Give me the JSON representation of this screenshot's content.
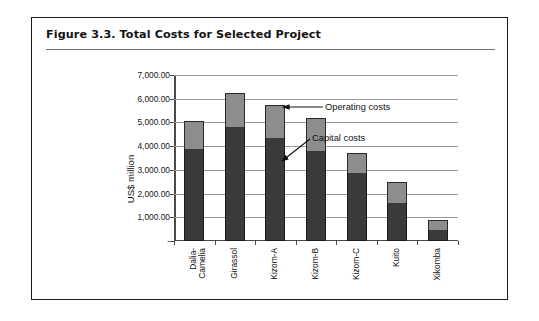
{
  "figure": {
    "title": "Figure 3.3.  Total Costs for Selected Project"
  },
  "chart_data": {
    "type": "bar",
    "subtype": "stacked",
    "title": "Figure 3.3.  Total Costs for Selected Project",
    "xlabel": "",
    "ylabel": "US$ million",
    "ylim": [
      0,
      7000
    ],
    "grid": true,
    "legend_position": "annotations",
    "ytick_labels": [
      "7,000.00",
      "6,000.00",
      "5,000.00",
      "4,000.00",
      "3,000.00",
      "2,000.00",
      "1,000.00",
      "-"
    ],
    "ytick_values": [
      7000,
      6000,
      5000,
      4000,
      3000,
      2000,
      1000,
      0
    ],
    "categories": [
      "Dalia-\nCamelia",
      "Girassol",
      "Kizom-A",
      "Kizom-B",
      "Kizom-C",
      "Kuito",
      "Xikomba"
    ],
    "series": [
      {
        "name": "Capital costs",
        "color": "#3a3a3a",
        "values": [
          3900,
          4800,
          4350,
          3800,
          2850,
          1600,
          450
        ]
      },
      {
        "name": "Operating costs",
        "color": "#8d8d8d",
        "values": [
          1150,
          1450,
          1400,
          1400,
          850,
          900,
          450
        ]
      }
    ],
    "totals": [
      5050,
      6250,
      5750,
      5200,
      3700,
      2500,
      900
    ],
    "annotations": [
      {
        "label": "Operating costs",
        "target_category": "Kizom-B",
        "target_series": "Operating costs"
      },
      {
        "label": "Capital costs",
        "target_category": "Kizom-B",
        "target_series": "Capital costs"
      }
    ]
  }
}
